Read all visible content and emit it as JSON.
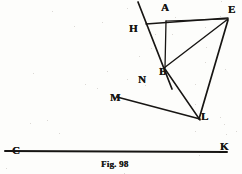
{
  "figure": {
    "caption": "Fig. 98",
    "caption_position": {
      "x": 101,
      "y": 159
    },
    "ink_color": "#171513",
    "paper_color": "#fdfdfb",
    "width": 242,
    "height": 174,
    "points": [
      {
        "name": "A",
        "label": "A",
        "x": 166,
        "y": 22,
        "label_x": 161,
        "label_y": 4
      },
      {
        "name": "E",
        "label": "E",
        "x": 228,
        "y": 18,
        "label_x": 229,
        "label_y": 6
      },
      {
        "name": "H",
        "label": "H",
        "x": 148,
        "y": 23,
        "label_x": 130,
        "label_y": 25
      },
      {
        "name": "B",
        "label": "B",
        "x": 164,
        "y": 67,
        "label_x": 160,
        "label_y": 69
      },
      {
        "name": "N",
        "label": "N",
        "x": 149,
        "y": 82,
        "label_x": 139,
        "label_y": 77
      },
      {
        "name": "M",
        "label": "M",
        "x": 118,
        "y": 97,
        "label_x": 111,
        "label_y": 95
      },
      {
        "name": "L",
        "label": "L",
        "x": 199,
        "y": 118,
        "label_x": 202,
        "label_y": 114
      },
      {
        "name": "K",
        "label": "K",
        "x": 226,
        "y": 150,
        "label_x": 221,
        "label_y": 144
      },
      {
        "name": "C",
        "label": "C",
        "x": 7,
        "y": 150,
        "label_x": 13,
        "label_y": 148
      }
    ],
    "segments": [
      {
        "name": "line-H-to-below-B",
        "x1": 138,
        "y1": 2,
        "x2": 172,
        "y2": 89,
        "width": 1.7
      },
      {
        "name": "line-H-to-E",
        "x1": 146,
        "y1": 24,
        "x2": 228,
        "y2": 18,
        "width": 1.4
      },
      {
        "name": "line-A-corner-to-E",
        "x1": 166,
        "y1": 21,
        "x2": 228,
        "y2": 19,
        "width": 1.2
      },
      {
        "name": "line-A-corner-vertical",
        "x1": 166,
        "y1": 21,
        "x2": 165,
        "y2": 68,
        "width": 1.3
      },
      {
        "name": "line-B-to-E",
        "x1": 164,
        "y1": 68,
        "x2": 228,
        "y2": 19,
        "width": 1.4
      },
      {
        "name": "line-C-to-K",
        "x1": 5,
        "y1": 151,
        "x2": 227,
        "y2": 152,
        "width": 2.0
      },
      {
        "name": "line-M-to-L",
        "x1": 117,
        "y1": 97,
        "x2": 200,
        "y2": 119,
        "width": 1.6
      },
      {
        "name": "line-E-to-L",
        "x1": 228,
        "y1": 20,
        "x2": 199,
        "y2": 119,
        "width": 1.7
      },
      {
        "name": "line-B-to-L",
        "x1": 165,
        "y1": 69,
        "x2": 200,
        "y2": 120,
        "width": 1.5
      }
    ]
  }
}
